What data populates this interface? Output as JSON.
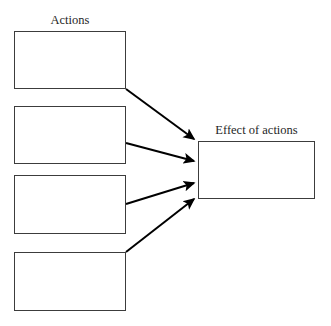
{
  "diagram": {
    "title_left": "Actions",
    "title_right": "Effect of actions",
    "background_color": "#ffffff",
    "box_border_color": "#3c3c3c",
    "arrow_color": "#000000",
    "canvas": {
      "width": 331,
      "height": 326
    },
    "left_boxes": [
      {
        "id": "action-box-1",
        "text": "",
        "x": 14,
        "y": 31,
        "width": 112,
        "height": 58
      },
      {
        "id": "action-box-2",
        "text": "",
        "x": 14,
        "y": 106,
        "width": 112,
        "height": 58
      },
      {
        "id": "action-box-3",
        "text": "",
        "x": 14,
        "y": 175,
        "width": 112,
        "height": 59
      },
      {
        "id": "action-box-4",
        "text": "",
        "x": 14,
        "y": 252,
        "width": 112,
        "height": 59
      }
    ],
    "right_box": {
      "id": "effect-box",
      "text": "",
      "x": 198,
      "y": 141,
      "width": 117,
      "height": 58
    },
    "arrows": [
      {
        "id": "arrow-1",
        "from": "action-box-1",
        "to": "effect-box",
        "x1": 126,
        "y1": 89,
        "x2": 196,
        "y2": 141
      },
      {
        "id": "arrow-2",
        "from": "action-box-2",
        "to": "effect-box",
        "x1": 126,
        "y1": 143,
        "x2": 196,
        "y2": 162
      },
      {
        "id": "arrow-3",
        "from": "action-box-3",
        "to": "effect-box",
        "x1": 126,
        "y1": 204,
        "x2": 196,
        "y2": 182
      },
      {
        "id": "arrow-4",
        "from": "action-box-4",
        "to": "effect-box",
        "x1": 126,
        "y1": 252,
        "x2": 196,
        "y2": 197
      }
    ]
  }
}
